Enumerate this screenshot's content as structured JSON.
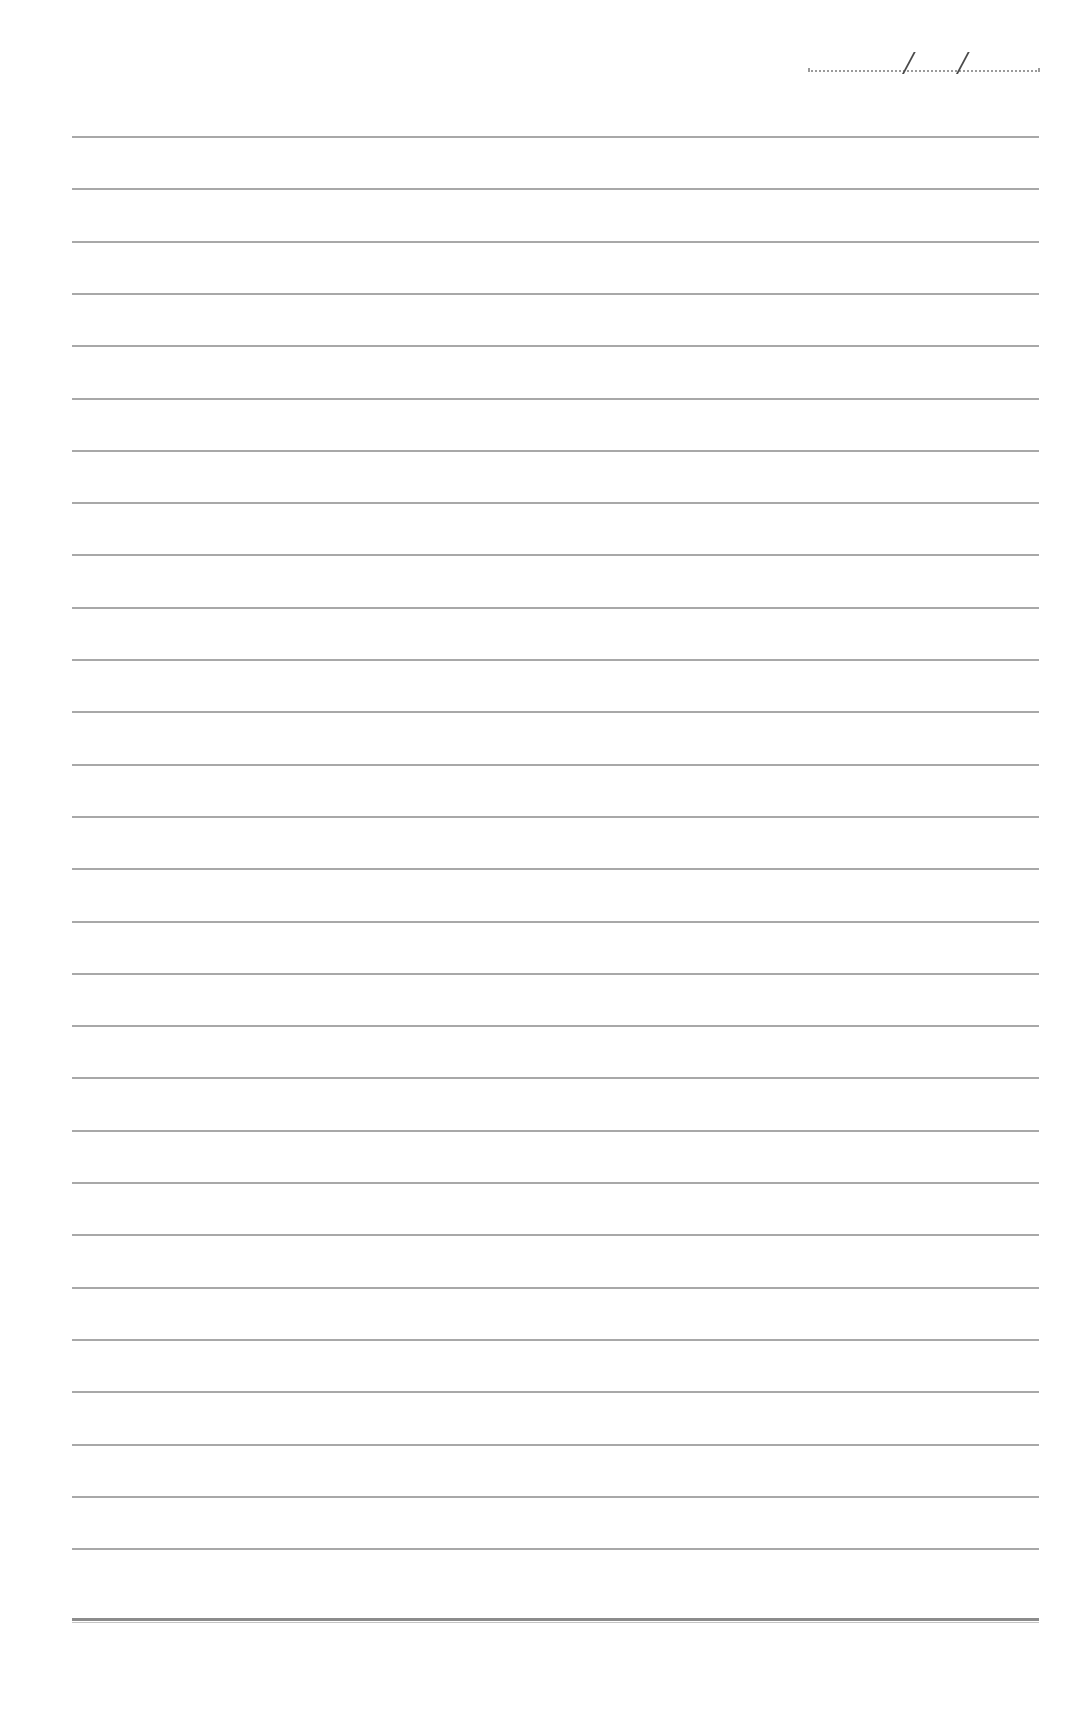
{
  "page": {
    "type": "ruled-notebook-sheet",
    "background": "#ffffff",
    "line_color": "#a8a8a8"
  },
  "date_field": {
    "separators": [
      "/",
      "/"
    ],
    "value": ""
  },
  "ruled_lines": {
    "count": 28,
    "first_y": 136,
    "spacing": 52.3,
    "left": 72,
    "right": 1040
  },
  "bottom_rule": {
    "style": "double",
    "y": 1618
  }
}
